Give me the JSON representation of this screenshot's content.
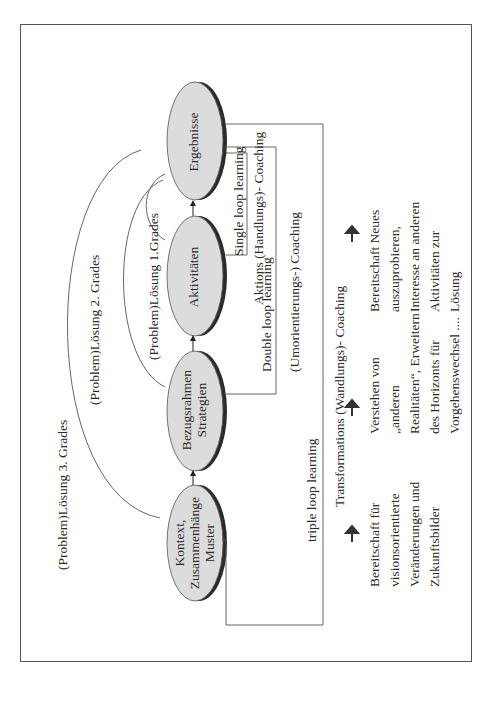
{
  "nodes": [
    {
      "id": "ergebnisse",
      "label": "Ergebnisse"
    },
    {
      "id": "aktivitaeten",
      "label": "Aktivitäten"
    },
    {
      "id": "bezugsrahmen",
      "label": "Bezugsrahmen\nStrategien"
    },
    {
      "id": "kontext",
      "label": "Kontext,\nZusammenhänge\nMuster"
    }
  ],
  "solutions": {
    "first": "(Problem)Lösung 1.Grades",
    "second": "(Problem)Lösung 2. Grades",
    "third": "(Problem)Lösung 3. Grades"
  },
  "loops": {
    "single": "Single loop learning",
    "double": "Double  loop learning",
    "triple": "triple loop learning"
  },
  "coaching": {
    "aktions": "Aktions (Handlungs)- Coaching",
    "umorientierungs": "(Umorientierungs-) Coaching",
    "transformations": "Transformations  (Wandlungs)- Coaching"
  },
  "outcomes": {
    "single": "Bereitschaft Neues\nauszuprobieren,\nInteresse an anderen\nAktivitäten zur\nLösung",
    "double": "Verstehen von\n„anderen\nRealitäten“, Erweitern\ndes Horizonts für\nVorgehenswechsel ....",
    "triple": "Bereitschaft für\nvisionsorientierte\nVeränderungen und\nZukunftsbilder"
  },
  "colors": {
    "ellipse_fill": "#dcdcdc",
    "ellipse_shadow": "#2b2b2b",
    "line": "#444444"
  }
}
